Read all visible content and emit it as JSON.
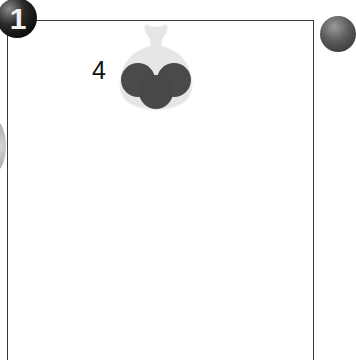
{
  "panel": {
    "badge_number": "1",
    "item_count": "4",
    "item_icon": "sack-of-balls-icon"
  },
  "colors": {
    "sack": "#e6e6e6",
    "ball": "#4a4a4a",
    "border": "#3a3a3a"
  }
}
